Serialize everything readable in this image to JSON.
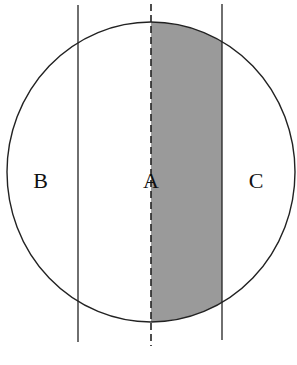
{
  "diagram": {
    "type": "circle-with-vertical-lines",
    "circle": {
      "cx": 151,
      "cy": 172,
      "rx": 144,
      "ry": 150,
      "stroke": "#222222"
    },
    "lines": [
      {
        "name": "left-line",
        "x": 78,
        "y1": 5,
        "y2": 342,
        "style": "solid"
      },
      {
        "name": "center-dashed-line",
        "x": 151,
        "y1": 4,
        "y2": 346,
        "style": "dashed"
      },
      {
        "name": "right-line",
        "x": 222,
        "y1": 4,
        "y2": 340,
        "style": "solid"
      }
    ],
    "shaded_region": {
      "between": [
        "center-dashed-line",
        "right-line"
      ],
      "fill": "#9a9a9a"
    },
    "labels": {
      "a": "A",
      "b": "B",
      "c": "C"
    }
  }
}
